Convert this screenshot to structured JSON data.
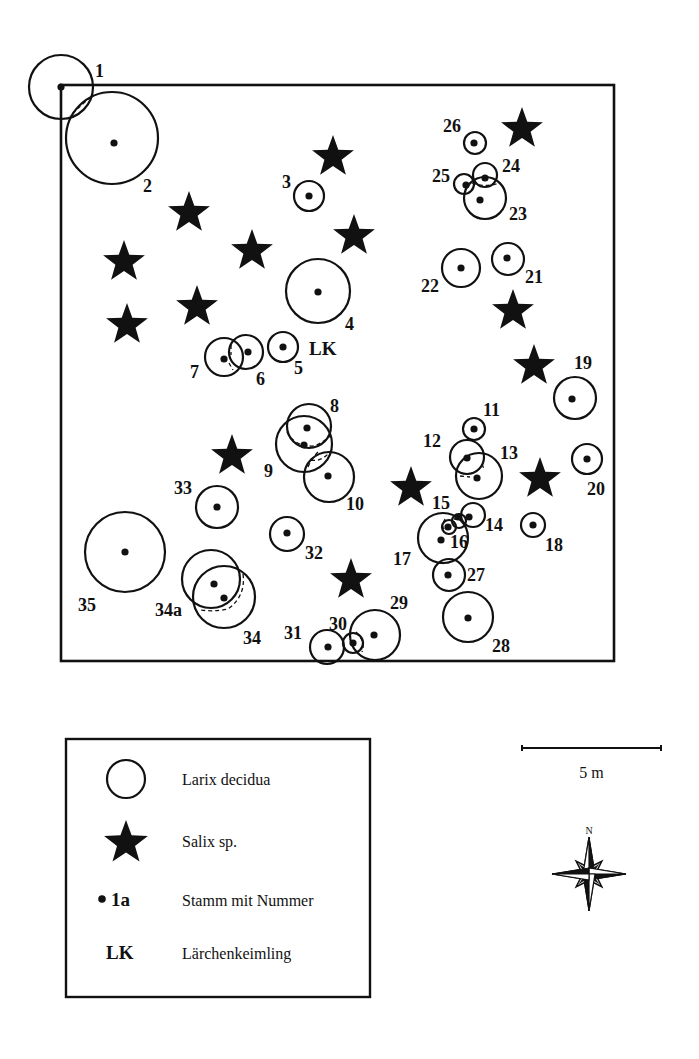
{
  "figure": {
    "frame": {
      "x": 61,
      "y": 85,
      "width": 553,
      "height": 576
    },
    "colors": {
      "ink": "#111111",
      "background": "#ffffff"
    },
    "larix_trees": [
      {
        "id": "1",
        "cx": 61,
        "cy": 87,
        "r": 32,
        "stems": [
          [
            61,
            87
          ]
        ],
        "label": {
          "text": "1",
          "x": 95,
          "y": 77
        }
      },
      {
        "id": "2",
        "cx": 112,
        "cy": 138,
        "r": 46,
        "stems": [
          [
            114,
            143
          ]
        ],
        "label": {
          "text": "2",
          "x": 143,
          "y": 192
        }
      },
      {
        "id": "3",
        "cx": 309,
        "cy": 196,
        "r": 15,
        "stems": [
          [
            309,
            196
          ]
        ],
        "label": {
          "text": "3",
          "x": 282,
          "y": 188
        }
      },
      {
        "id": "4",
        "cx": 318,
        "cy": 291,
        "r": 32,
        "stems": [
          [
            318,
            292
          ]
        ],
        "label": {
          "text": "4",
          "x": 345,
          "y": 330
        }
      },
      {
        "id": "5",
        "cx": 283,
        "cy": 347,
        "r": 15,
        "stems": [
          [
            283,
            347
          ]
        ],
        "label": {
          "text": "5",
          "x": 294,
          "y": 374
        }
      },
      {
        "id": "6",
        "cx": 246,
        "cy": 352,
        "r": 17,
        "stems": [
          [
            248,
            352
          ]
        ],
        "label": {
          "text": "6",
          "x": 256,
          "y": 385
        }
      },
      {
        "id": "7",
        "cx": 224,
        "cy": 357,
        "r": 19,
        "stems": [
          [
            224,
            359
          ]
        ],
        "label": {
          "text": "7",
          "x": 190,
          "y": 378
        }
      },
      {
        "id": "8",
        "cx": 309,
        "cy": 426,
        "r": 22,
        "stems": [
          [
            307,
            428
          ]
        ],
        "label": {
          "text": "8",
          "x": 330,
          "y": 412
        }
      },
      {
        "id": "9",
        "cx": 304,
        "cy": 444,
        "r": 28,
        "stems": [
          [
            304,
            445
          ]
        ],
        "label": {
          "text": "9",
          "x": 264,
          "y": 477
        }
      },
      {
        "id": "10",
        "cx": 329,
        "cy": 477,
        "r": 25,
        "stems": [
          [
            328,
            476
          ]
        ],
        "label": {
          "text": "10",
          "x": 346,
          "y": 510
        }
      },
      {
        "id": "11",
        "cx": 474,
        "cy": 429,
        "r": 11,
        "stems": [
          [
            474,
            429
          ]
        ],
        "label": {
          "text": "11",
          "x": 483,
          "y": 416
        }
      },
      {
        "id": "12",
        "cx": 467,
        "cy": 457,
        "r": 17,
        "stems": [
          [
            467,
            458
          ]
        ],
        "label": {
          "text": "12",
          "x": 423,
          "y": 447
        }
      },
      {
        "id": "13",
        "cx": 479,
        "cy": 476,
        "r": 23,
        "stems": [
          [
            477,
            478
          ]
        ],
        "label": {
          "text": "13",
          "x": 500,
          "y": 459
        }
      },
      {
        "id": "14",
        "cx": 473,
        "cy": 515,
        "r": 12,
        "stems": [
          [
            469,
            517
          ]
        ],
        "label": {
          "text": "14",
          "x": 485,
          "y": 531
        }
      },
      {
        "id": "15",
        "cx": 459,
        "cy": 521,
        "r": 7,
        "stems": [
          [
            458,
            517
          ]
        ],
        "label": {
          "text": "15",
          "x": 432,
          "y": 509
        }
      },
      {
        "id": "16",
        "cx": 449,
        "cy": 527,
        "r": 7,
        "stems": [
          [
            448,
            527
          ]
        ],
        "label": {
          "text": "16",
          "x": 450,
          "y": 548
        }
      },
      {
        "id": "17",
        "cx": 443,
        "cy": 538,
        "r": 25,
        "stems": [
          [
            441,
            540
          ]
        ],
        "label": {
          "text": "17",
          "x": 393,
          "y": 565
        }
      },
      {
        "id": "18",
        "cx": 533,
        "cy": 525,
        "r": 12,
        "stems": [
          [
            533,
            525
          ]
        ],
        "label": {
          "text": "18",
          "x": 545,
          "y": 551
        }
      },
      {
        "id": "19",
        "cx": 575,
        "cy": 398,
        "r": 21,
        "stems": [
          [
            572,
            399
          ]
        ],
        "label": {
          "text": "19",
          "x": 574,
          "y": 369
        }
      },
      {
        "id": "20",
        "cx": 587,
        "cy": 459,
        "r": 15,
        "stems": [
          [
            587,
            459
          ]
        ],
        "label": {
          "text": "20",
          "x": 587,
          "y": 495
        }
      },
      {
        "id": "21",
        "cx": 508,
        "cy": 259,
        "r": 16,
        "stems": [
          [
            507,
            258
          ]
        ],
        "label": {
          "text": "21",
          "x": 525,
          "y": 283
        }
      },
      {
        "id": "22",
        "cx": 461,
        "cy": 268,
        "r": 19,
        "stems": [
          [
            461,
            268
          ]
        ],
        "label": {
          "text": "22",
          "x": 421,
          "y": 292
        }
      },
      {
        "id": "23",
        "cx": 485,
        "cy": 198,
        "r": 21,
        "stems": [
          [
            480,
            200
          ]
        ],
        "label": {
          "text": "23",
          "x": 509,
          "y": 220
        }
      },
      {
        "id": "24",
        "cx": 485,
        "cy": 175,
        "r": 12,
        "stems": [
          [
            485,
            178
          ]
        ],
        "label": {
          "text": "24",
          "x": 502,
          "y": 172
        }
      },
      {
        "id": "25",
        "cx": 464,
        "cy": 184,
        "r": 10,
        "stems": [
          [
            466,
            185
          ]
        ],
        "label": {
          "text": "25",
          "x": 432,
          "y": 182
        }
      },
      {
        "id": "26",
        "cx": 475,
        "cy": 143,
        "r": 11,
        "stems": [
          [
            474,
            143
          ]
        ],
        "label": {
          "text": "26",
          "x": 443,
          "y": 132
        }
      },
      {
        "id": "27",
        "cx": 449,
        "cy": 575,
        "r": 16,
        "stems": [
          [
            448,
            575
          ]
        ],
        "label": {
          "text": "27",
          "x": 467,
          "y": 581
        }
      },
      {
        "id": "28",
        "cx": 468,
        "cy": 617,
        "r": 25,
        "stems": [
          [
            468,
            618
          ]
        ],
        "label": {
          "text": "28",
          "x": 492,
          "y": 652
        }
      },
      {
        "id": "29",
        "cx": 375,
        "cy": 635,
        "r": 25,
        "stems": [
          [
            374,
            635
          ]
        ],
        "label": {
          "text": "29",
          "x": 390,
          "y": 609
        }
      },
      {
        "id": "30",
        "cx": 353,
        "cy": 643,
        "r": 10,
        "stems": [
          [
            353,
            643
          ]
        ],
        "label": {
          "text": "30",
          "x": 329,
          "y": 630
        }
      },
      {
        "id": "31",
        "cx": 327,
        "cy": 647,
        "r": 17,
        "stems": [
          [
            328,
            647
          ]
        ],
        "label": {
          "text": "31",
          "x": 284,
          "y": 639
        }
      },
      {
        "id": "32",
        "cx": 287,
        "cy": 534,
        "r": 17,
        "stems": [
          [
            287,
            533
          ]
        ],
        "label": {
          "text": "32",
          "x": 305,
          "y": 559
        }
      },
      {
        "id": "33",
        "cx": 217,
        "cy": 507,
        "r": 21,
        "stems": [
          [
            217,
            507
          ]
        ],
        "label": {
          "text": "33",
          "x": 174,
          "y": 494
        }
      },
      {
        "id": "34a",
        "cx": 211,
        "cy": 579,
        "r": 29,
        "stems": [
          [
            214,
            584
          ]
        ],
        "label": {
          "text": "34a",
          "x": 155,
          "y": 616
        }
      },
      {
        "id": "34",
        "cx": 224,
        "cy": 597,
        "r": 31,
        "stems": [
          [
            224,
            598
          ]
        ],
        "label": {
          "text": "34",
          "x": 243,
          "y": 644
        }
      },
      {
        "id": "35",
        "cx": 125,
        "cy": 552,
        "r": 40,
        "stems": [
          [
            125,
            552
          ]
        ],
        "label": {
          "text": "35",
          "x": 78,
          "y": 611
        }
      }
    ],
    "crown_overlaps": [
      {
        "d": "M 91 97 Q 80 106 70 116"
      },
      {
        "d": "M 472 183 Q 485 188 499 183"
      },
      {
        "d": "M 231 345 L 231 355 M 229 363 L 233 370"
      },
      {
        "d": "M 287 432 Q 295 447 314 446 Q 324 442 330 436"
      },
      {
        "d": "M 311 460 Q 320 462 328 454"
      },
      {
        "d": "M 308 467 Q 312 458 318 452"
      },
      {
        "d": "M 460 476 L 470 477 M 482 464 L 484 469"
      },
      {
        "d": "M 243 574 Q 246 596 228 609 Q 214 612 201 610"
      },
      {
        "d": "M 445 519 Q 440 528 446 530 M 454 519 L 457 519"
      },
      {
        "d": "M 440 563 L 446 564"
      },
      {
        "d": "M 356 632 Q 366 642 362 652"
      }
    ],
    "salix_willows": [
      {
        "cx": 333,
        "cy": 157
      },
      {
        "cx": 189,
        "cy": 213
      },
      {
        "cx": 354,
        "cy": 236
      },
      {
        "cx": 124,
        "cy": 262
      },
      {
        "cx": 252,
        "cy": 251
      },
      {
        "cx": 127,
        "cy": 325
      },
      {
        "cx": 197,
        "cy": 307
      },
      {
        "cx": 522,
        "cy": 129
      },
      {
        "cx": 513,
        "cy": 311
      },
      {
        "cx": 534,
        "cy": 366
      },
      {
        "cx": 232,
        "cy": 456
      },
      {
        "cx": 411,
        "cy": 488
      },
      {
        "cx": 540,
        "cy": 479
      },
      {
        "cx": 351,
        "cy": 580
      }
    ],
    "seedling": {
      "text": "LK",
      "x": 309,
      "y": 355
    }
  },
  "legend": {
    "box": {
      "x": 66,
      "y": 739,
      "width": 304,
      "height": 258
    },
    "items": [
      {
        "symbol": "circle",
        "label": "Larix decidua"
      },
      {
        "symbol": "star",
        "label": "Salix sp."
      },
      {
        "symbol": "dot",
        "symbol_text": "1a",
        "label": "Stamm mit Nummer"
      },
      {
        "symbol": "text",
        "symbol_text": "LK",
        "label": "Lärchenkeimling"
      }
    ]
  },
  "scale_bar": {
    "label": "5 m",
    "x1": 522,
    "x2": 661,
    "y": 748
  },
  "compass": {
    "label": "N",
    "cx": 589,
    "cy": 874
  }
}
